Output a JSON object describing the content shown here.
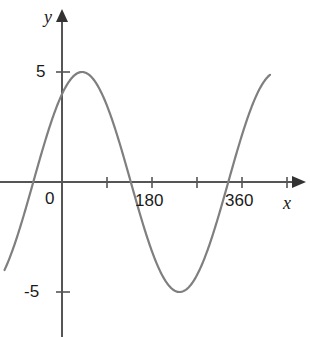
{
  "chart_data": {
    "type": "line",
    "title": "",
    "subtitle": "",
    "xlabel": "x",
    "ylabel": "y",
    "xlim": [
      -115,
      465
    ],
    "ylim": [
      -7.5,
      7.7
    ],
    "grid": false,
    "legend": null,
    "x_ticks": [
      {
        "value": 0,
        "label": "0"
      },
      {
        "value": 90,
        "label": ""
      },
      {
        "value": 180,
        "label": "180"
      },
      {
        "value": 270,
        "label": ""
      },
      {
        "value": 360,
        "label": "360"
      },
      {
        "value": 450,
        "label": ""
      }
    ],
    "y_ticks": [
      {
        "value": 5,
        "label": "5"
      },
      {
        "value": -5,
        "label": "-5"
      }
    ],
    "annotations": [],
    "series": [
      {
        "name": "sine curve",
        "color": "#7f7f7f",
        "amplitude": 5,
        "period_degrees": 390,
        "phase_degrees": 53,
        "equation": "y = 5 sin(0.923x + 53)",
        "x_start": -115,
        "x_end": 417,
        "key_points": [
          {
            "x": -115,
            "y": -5.6,
            "label": "left end of curve"
          },
          {
            "x": -58,
            "y": 0,
            "label": "rising zero crossing"
          },
          {
            "x": 0,
            "y": 4.0,
            "label": "y-intercept"
          },
          {
            "x": 32,
            "y": 5,
            "label": "maximum"
          },
          {
            "x": 130,
            "y": 0,
            "label": "falling zero crossing"
          },
          {
            "x": 227,
            "y": -5,
            "label": "minimum"
          },
          {
            "x": 324,
            "y": 0,
            "label": "rising zero crossing"
          },
          {
            "x": 417,
            "y": 5.0,
            "label": "right end of curve"
          }
        ],
        "x": [
          -115,
          -100,
          -85,
          -70,
          -58,
          -45,
          -30,
          -15,
          0,
          15,
          32,
          50,
          65,
          80,
          100,
          115,
          130,
          145,
          160,
          180,
          200,
          215,
          227,
          245,
          260,
          280,
          300,
          324,
          340,
          355,
          370,
          385,
          400,
          417
        ],
        "y": [
          -5.6,
          -4.0,
          -2.8,
          -1.3,
          0.0,
          1.3,
          2.6,
          3.5,
          4.0,
          4.7,
          5.0,
          4.9,
          4.6,
          4.0,
          2.9,
          1.6,
          0.0,
          -1.3,
          -2.5,
          -3.8,
          -4.7,
          -4.95,
          -5.0,
          -4.8,
          -4.3,
          -3.2,
          -1.8,
          0.0,
          1.3,
          2.4,
          3.3,
          4.1,
          4.6,
          5.0
        ]
      }
    ],
    "axes_color": "#555555",
    "curve_color": "#7f7f7f",
    "background_color": "#ffffff"
  }
}
